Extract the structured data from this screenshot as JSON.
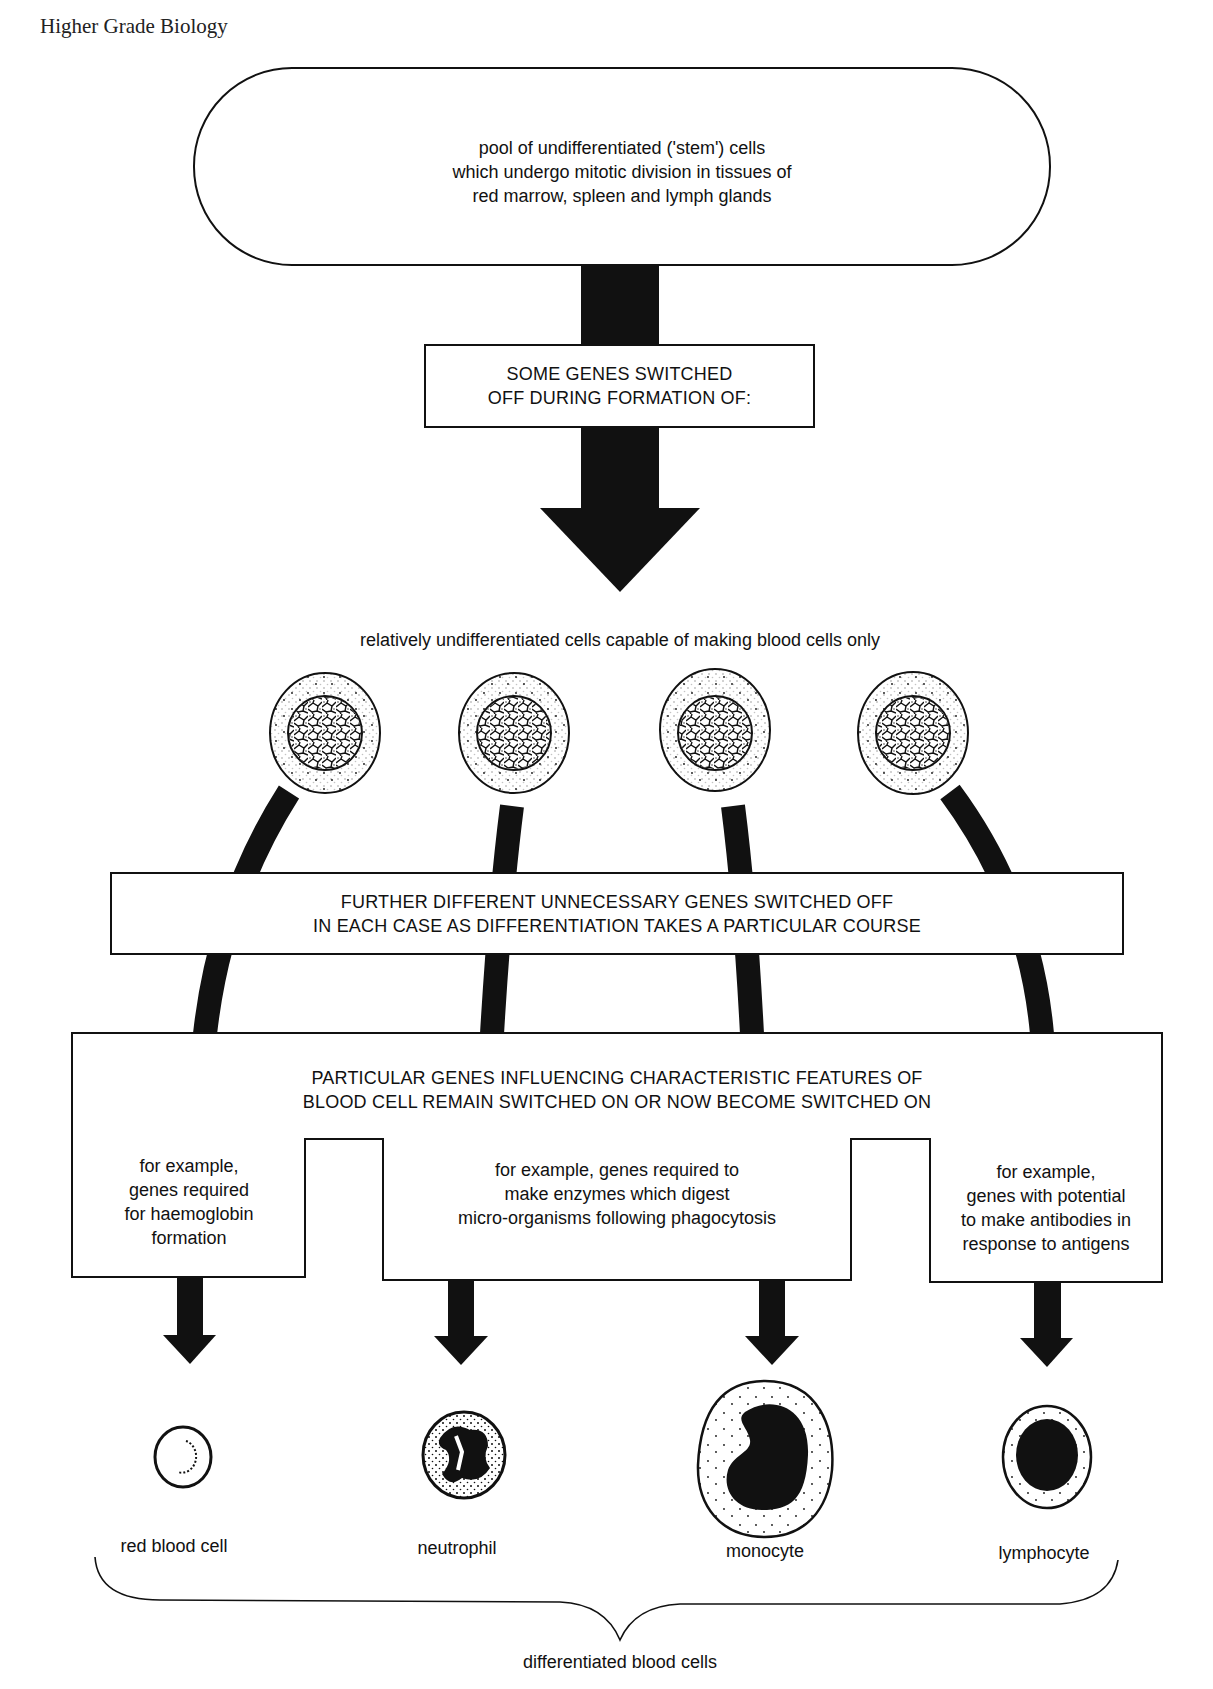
{
  "page": {
    "running_head": "Higher Grade Biology"
  },
  "diagram": {
    "stem_pool": {
      "text": "pool of undifferentiated ('stem') cells\nwhich undergo mitotic division in tissues of\nred marrow, spleen and lymph glands"
    },
    "step1_box": {
      "text": "SOME GENES SWITCHED\nOFF DURING FORMATION OF:"
    },
    "progenitor_caption": "relatively undifferentiated cells capable of making blood cells only",
    "step2_box": {
      "text": "FURTHER DIFFERENT UNNECESSARY GENES SWITCHED OFF\nIN EACH CASE AS DIFFERENTIATION TAKES A PARTICULAR COURSE"
    },
    "step3_box": {
      "heading": "PARTICULAR GENES INFLUENCING CHARACTERISTIC FEATURES OF\nBLOOD CELL REMAIN SWITCHED ON OR NOW BECOME SWITCHED ON",
      "examples": [
        {
          "text": "for example,\ngenes required\nfor haemoglobin\nformation"
        },
        {
          "text": "for example, genes required to\nmake enzymes which digest\nmicro-organisms following phagocytosis"
        },
        {
          "text": "for example,\ngenes with potential\nto make antibodies in\nresponse to antigens"
        }
      ]
    },
    "differentiated_cells": [
      {
        "name": "red blood cell"
      },
      {
        "name": "neutrophil"
      },
      {
        "name": "monocyte"
      },
      {
        "name": "lymphocyte"
      }
    ],
    "bracket_label": "differentiated blood cells"
  },
  "colors": {
    "ink": "#111111",
    "paper": "#ffffff"
  }
}
